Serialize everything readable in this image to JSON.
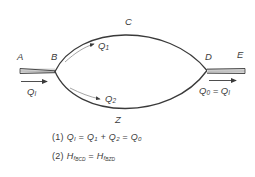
{
  "figure": {
    "kind": "pipe-network-parallel-branch-diagram",
    "background_color": "#ffffff",
    "line_color": "#3a3a3a",
    "pipe_fill_color": "#d8d8d8"
  },
  "nodes": [
    {
      "id": "A",
      "label": "A"
    },
    {
      "id": "B",
      "label": "B"
    },
    {
      "id": "C",
      "label": "C"
    },
    {
      "id": "D",
      "label": "D"
    },
    {
      "id": "E",
      "label": "E"
    },
    {
      "id": "Z",
      "label": "Z"
    }
  ],
  "flows": {
    "inlet": {
      "symbol": "Q",
      "sub": "I"
    },
    "upper_branch": {
      "symbol": "Q",
      "sub": "1"
    },
    "lower_branch": {
      "symbol": "Q",
      "sub": "2"
    },
    "outlet": {
      "symbol": "Q",
      "sub": "0",
      "equals": "=",
      "equals_to_symbol": "Q",
      "equals_to_sub": "I"
    }
  },
  "equations": [
    {
      "number": "(1)",
      "terms": [
        {
          "symbol": "Q",
          "sub": "I"
        },
        {
          "op": "="
        },
        {
          "symbol": "Q",
          "sub": "1"
        },
        {
          "op": "+"
        },
        {
          "symbol": "Q",
          "sub": "2"
        },
        {
          "op": "="
        },
        {
          "symbol": "Q",
          "sub": "0"
        }
      ],
      "text": "(1) Q_I = Q_1 + Q_2 = Q_0"
    },
    {
      "number": "(2)",
      "terms": [
        {
          "symbol": "H",
          "sub": "f",
          "subsub": "BCD"
        },
        {
          "op": "="
        },
        {
          "symbol": "H",
          "sub": "f",
          "subsub": "BZD"
        }
      ],
      "text": "(2) H_fBCD = H_fBZD"
    }
  ],
  "eq1": {
    "num": "(1)",
    "q_in": "Q",
    "sub_in": "I",
    "eq1_op": "=",
    "q_1": "Q",
    "sub_1": "1",
    "plus_op": "+",
    "q_2": "Q",
    "sub_2": "2",
    "eq2_op": "=",
    "q_0": "Q",
    "sub_0": "0"
  },
  "eq2": {
    "num": "(2)",
    "h_left": "H",
    "f_left": "f",
    "path_left": "BCD",
    "eq_op": "=",
    "h_right": "H",
    "f_right": "f",
    "path_right": "BZD"
  }
}
